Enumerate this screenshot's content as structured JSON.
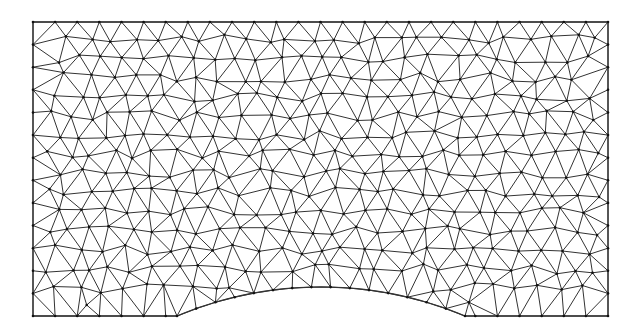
{
  "figure": {
    "type": "triangular-finite-element-mesh",
    "line_color": "#333333",
    "node_color": "#111111",
    "background": "#ffffff"
  },
  "domain_geometry": {
    "left": 33,
    "top": 22,
    "right": 608,
    "bottom": 316,
    "notch": {
      "start_x": 177,
      "end_x": 465,
      "peak_x": 321,
      "peak_y": 287,
      "shape": "arc"
    }
  },
  "mesh": {
    "target_edge_length": 22,
    "approx_nodes_across": 27,
    "approx_nodes_down": 14,
    "seed": 7
  }
}
